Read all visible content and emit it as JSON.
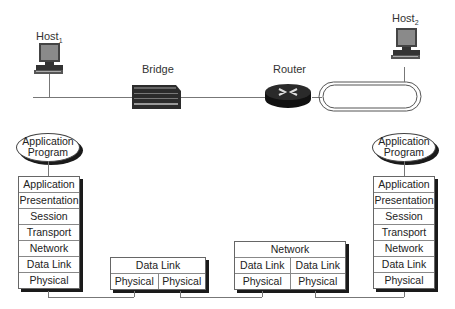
{
  "devices": {
    "host1": {
      "label": "Host",
      "sub": "1"
    },
    "bridge": {
      "label": "Bridge"
    },
    "router": {
      "label": "Router"
    },
    "host2": {
      "label": "Host",
      "sub": "2"
    }
  },
  "app_program": {
    "line1": "Application",
    "line2": "Program"
  },
  "host1_stack": [
    "Application",
    "Presentation",
    "Session",
    "Transport",
    "Network",
    "Data Link",
    "Physical"
  ],
  "host2_stack": [
    "Application",
    "Presentation",
    "Session",
    "Transport",
    "Network",
    "Data Link",
    "Physical"
  ],
  "bridge_stack": {
    "top": "Data Link",
    "left": "Physical",
    "right": "Physical"
  },
  "router_stack": {
    "top": "Network",
    "dl_left": "Data Link",
    "dl_right": "Data Link",
    "ph_left": "Physical",
    "ph_right": "Physical"
  }
}
